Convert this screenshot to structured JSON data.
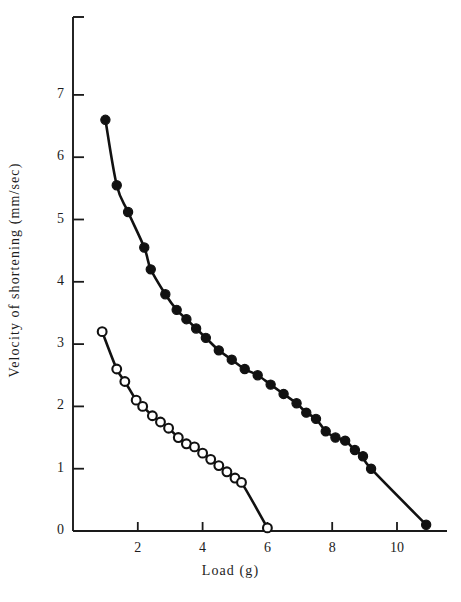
{
  "figure": {
    "background_color": "#ffffff",
    "ink_color": "#1a1a1a",
    "caption_fragment": ""
  },
  "axes": {
    "x_title": "Load (g)",
    "y_title": "Velocity of shortening (mm/sec)",
    "x_ticks": [
      "2",
      "4",
      "6",
      "8",
      "10"
    ],
    "y_ticks": [
      "0",
      "1",
      "2",
      "3",
      "4",
      "5",
      "6",
      "7"
    ]
  },
  "chart_data": {
    "type": "scatter",
    "title": "",
    "subtitle": "",
    "xlabel": "Load (g)",
    "ylabel": "Velocity of shortening (mm/sec)",
    "xlim": [
      0,
      12
    ],
    "ylim": [
      0,
      7.9
    ],
    "x_ticks": [
      2,
      4,
      6,
      8,
      10
    ],
    "y_ticks": [
      0,
      1,
      2,
      3,
      4,
      5,
      6,
      7
    ],
    "grid": false,
    "legend": "none",
    "annotations": [],
    "series": [
      {
        "name": "filled-circles",
        "marker": "filled-circle",
        "marker_color": "#111111",
        "line_color": "#111111",
        "points": [
          [
            1.0,
            6.6
          ],
          [
            1.35,
            5.55
          ],
          [
            1.7,
            5.12
          ],
          [
            2.2,
            4.55
          ],
          [
            2.4,
            4.2
          ],
          [
            2.85,
            3.8
          ],
          [
            3.2,
            3.55
          ],
          [
            3.5,
            3.4
          ],
          [
            3.8,
            3.25
          ],
          [
            4.1,
            3.1
          ],
          [
            4.5,
            2.9
          ],
          [
            4.9,
            2.75
          ],
          [
            5.3,
            2.6
          ],
          [
            5.7,
            2.5
          ],
          [
            6.1,
            2.35
          ],
          [
            6.5,
            2.2
          ],
          [
            6.9,
            2.05
          ],
          [
            7.2,
            1.9
          ],
          [
            7.5,
            1.8
          ],
          [
            7.8,
            1.6
          ],
          [
            8.1,
            1.5
          ],
          [
            8.4,
            1.45
          ],
          [
            8.7,
            1.3
          ],
          [
            8.95,
            1.2
          ],
          [
            9.2,
            1.0
          ],
          [
            10.9,
            0.1
          ]
        ]
      },
      {
        "name": "open-circles",
        "marker": "open-circle",
        "marker_color": "#ffffff",
        "line_color": "#111111",
        "points": [
          [
            0.9,
            3.2
          ],
          [
            1.35,
            2.6
          ],
          [
            1.6,
            2.4
          ],
          [
            1.95,
            2.1
          ],
          [
            2.15,
            2.0
          ],
          [
            2.45,
            1.85
          ],
          [
            2.7,
            1.75
          ],
          [
            2.95,
            1.65
          ],
          [
            3.25,
            1.5
          ],
          [
            3.5,
            1.4
          ],
          [
            3.75,
            1.35
          ],
          [
            4.0,
            1.25
          ],
          [
            4.25,
            1.15
          ],
          [
            4.5,
            1.05
          ],
          [
            4.75,
            0.95
          ],
          [
            5.0,
            0.85
          ],
          [
            5.2,
            0.78
          ],
          [
            6.0,
            0.05
          ]
        ]
      }
    ]
  }
}
